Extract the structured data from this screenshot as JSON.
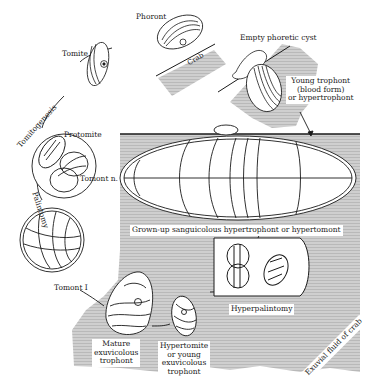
{
  "diagram": {
    "type": "life-cycle",
    "colors": {
      "ink": "#1a1a1a",
      "host_fluid": "#c9c9c9",
      "paper": "#ffffff"
    },
    "labels": {
      "phoront": "Phoront",
      "crab": "Crab",
      "empty_phoretic_cyst": "Empty phoretic cyst",
      "young_trophont_1": "Young trophont",
      "young_trophont_2": "(blood form)",
      "young_trophont_3": "or hypertrophont",
      "tomite": "Tomite",
      "tomitogenesis": "Tomitogenesis",
      "protomite": "Protomite",
      "tomont_n": "Tomont n.",
      "palintomy": "Palintomy",
      "grown_up": "Grown-up sanguicolous hypertrophont or hypertomont",
      "tomont_1": "Tomont I",
      "hyperpalintomy": "Hyperpalintomy",
      "mature_1": "Mature",
      "mature_2": "exuvicolous",
      "mature_3": "trophont",
      "hypertomite_1": "Hypertomite",
      "hypertomite_2": "or young",
      "hypertomite_3": "exuvicolous",
      "hypertomite_4": "trophont",
      "exuvial_fluid": "Exuvial fluid of crab"
    },
    "stages": [
      "Phoront",
      "Young trophont (blood form) or hypertrophont",
      "Grown-up sanguicolous hypertrophont or hypertomont",
      "Hyperpalintomy",
      "Hypertomite or young exuvicolous trophont",
      "Mature exuvicolous trophont",
      "Tomont I",
      "Tomont n.",
      "Protomite",
      "Tomite"
    ],
    "processes": [
      "Tomitogenesis",
      "Palintomy",
      "Hyperpalintomy"
    ]
  }
}
